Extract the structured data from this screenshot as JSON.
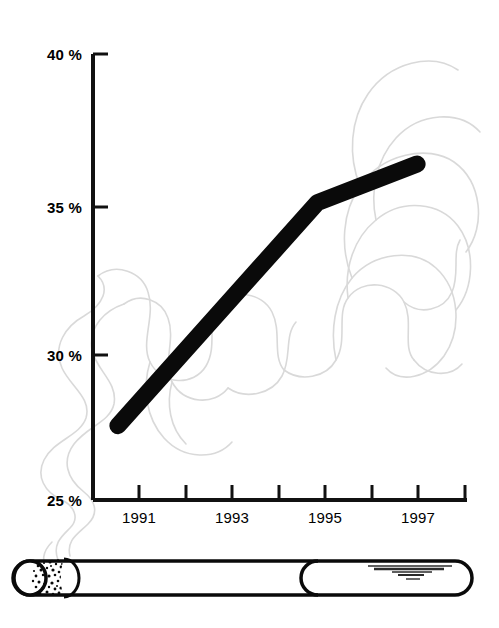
{
  "chart_data": {
    "type": "line",
    "title": "",
    "subtitle": "",
    "xlabel": "",
    "ylabel": "",
    "x": [
      1991,
      1995,
      1997
    ],
    "values": [
      27.5,
      35.0,
      36.3
    ],
    "series": [
      {
        "name": "Smoking rate",
        "x": [
          1991,
          1995,
          1997
        ],
        "values": [
          27.5,
          35.0,
          36.3
        ]
      }
    ],
    "xlim": [
      1990.5,
      1998.0
    ],
    "ylim": [
      25,
      40
    ],
    "ytick_values": [
      40,
      35,
      30,
      25
    ],
    "ytick_labels": [
      "40 %",
      "35 %",
      "30 %",
      "25 %"
    ],
    "xtick_values": [
      1991,
      1992,
      1993,
      1994,
      1995,
      1996,
      1997,
      1998
    ],
    "xtick_labels": [
      "1991",
      "",
      "1993",
      "",
      "1995",
      "",
      "1997",
      ""
    ],
    "grid": false,
    "legend": null,
    "legend_position": "none",
    "annotations": [],
    "line_color": "#0a0a0a",
    "axis_color": "#111111",
    "smoke_color": "#d8d8d8",
    "background_color": "#ffffff"
  },
  "axes": {
    "y_ticks": [
      {
        "label": "40 %",
        "value": 40
      },
      {
        "label": "35 %",
        "value": 35
      },
      {
        "label": "30 %",
        "value": 30
      },
      {
        "label": "25 %",
        "value": 25
      }
    ],
    "x_ticks": [
      {
        "label": "1991",
        "value": 1991
      },
      {
        "label": "",
        "value": 1992
      },
      {
        "label": "1993",
        "value": 1993
      },
      {
        "label": "",
        "value": 1994
      },
      {
        "label": "1995",
        "value": 1995
      },
      {
        "label": "",
        "value": 1996
      },
      {
        "label": "1997",
        "value": 1997
      },
      {
        "label": "",
        "value": 1998
      }
    ]
  },
  "illustration": {
    "name": "cigarette",
    "parts": {
      "burning_tip": "ember-stippled-end",
      "paper_body": "cigarette-paper",
      "filter": "cigarette-filter",
      "brand_lines": "filter-marking-lines",
      "smoke": "smoke-wisps"
    }
  },
  "colors": {
    "ink": "#0a0a0a",
    "smoke": "#d8d8d8",
    "paper": "#ffffff"
  }
}
